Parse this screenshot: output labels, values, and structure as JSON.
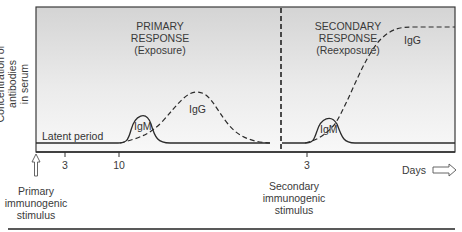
{
  "diagram": {
    "y_axis_label_line1": "Concentration of antibodies",
    "y_axis_label_line2": "in serum",
    "primary": {
      "title_line1": "PRIMARY",
      "title_line2": "RESPONSE",
      "title_line3": "(Exposure)",
      "latent_label": "Latent period",
      "igm_label": "IgM",
      "igg_label": "IgG",
      "stimulus_line1": "Primary",
      "stimulus_line2": "immunogenic",
      "stimulus_line3": "stimulus"
    },
    "secondary": {
      "title_line1": "SECONDARY",
      "title_line2": "RESPONSE",
      "title_line3": "(Reexposure)",
      "igm_label": "IgM",
      "igg_label": "IgG",
      "stimulus_line1": "Secondary",
      "stimulus_line2": "immunogenic",
      "stimulus_line3": "stimulus"
    },
    "x_ticks": [
      "3",
      "10",
      "3"
    ],
    "x_axis_label": "Days",
    "colors": {
      "frame": "#333333",
      "bg_top": "#d6d6d6",
      "bg_bottom": "#f7f7f7",
      "curve": "#2b2b2b"
    }
  }
}
